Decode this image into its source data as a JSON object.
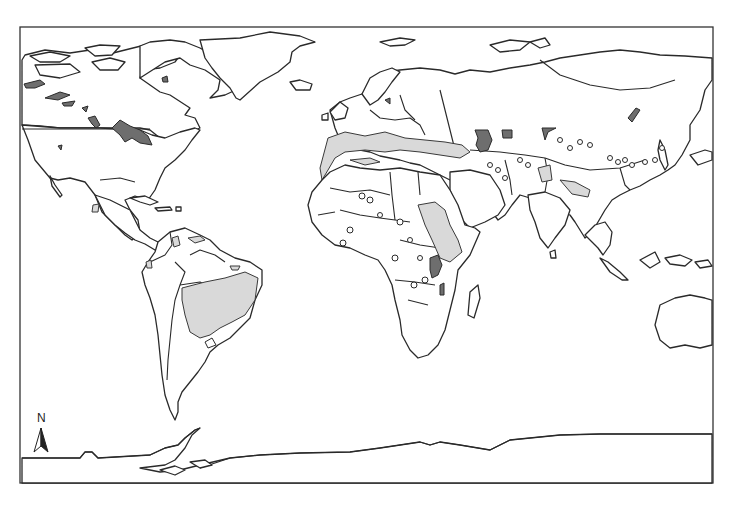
{
  "map": {
    "type": "world-outline-map",
    "projection": "equirectangular-style",
    "frame": {
      "x": 20,
      "y": 27,
      "width": 693,
      "height": 456
    },
    "colors": {
      "land_fill": "#ffffff",
      "outline": "#2a2a2a",
      "light_shaded_region": "#d9d9d9",
      "dark_shaded_region": "#6e6e6e",
      "background": "#ffffff"
    },
    "legend": null,
    "north_arrow": {
      "label": "N",
      "position": "bottom-left"
    },
    "shaded_regions": {
      "light": [
        "Mediterranean coast / southern Europe",
        "North Africa (Morocco / Algeria coast)",
        "Ethiopia / Sudan highlands",
        "East Africa (Kenya / Somalia)",
        "Northern India / Ganges plain",
        "Pakistan / Indus",
        "Central Brazil / Paraguay",
        "Arabian Peninsula south-west"
      ],
      "dark": [
        "Canadian prairies / Great Lakes region",
        "Northern Canada patches",
        "Caspian Sea region",
        "Aral Sea region",
        "Lake Malawi / Rift Valley",
        "Lake Balkhash",
        "Siberian patch"
      ]
    }
  }
}
